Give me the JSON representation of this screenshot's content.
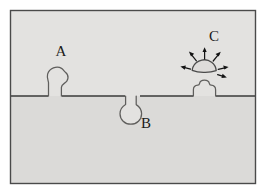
{
  "figure": {
    "frame": {
      "border_color": "#4a4a4a",
      "border_width": 1,
      "x": 10,
      "y": 10,
      "width": 246,
      "height": 174
    },
    "regions": [
      {
        "name": "upper-medium",
        "label": "",
        "fill": "#e3e2e0",
        "description": "region above the interface line"
      },
      {
        "name": "lower-substrate",
        "label": "",
        "fill": "#dbdad8",
        "description": "region below the interface line"
      }
    ],
    "interface": {
      "name": "surface-line",
      "y": 96,
      "stroke": "#3a3a3a",
      "stroke_width": 1.6
    },
    "features": [
      {
        "id": "A",
        "label": "A",
        "label_x": 61,
        "label_y": 56,
        "kind": "protruding-nucleus",
        "description": "irregular blob on a narrow neck rising above the surface",
        "outline_stroke": "#5a5a5a",
        "fill": "#e3e2e0"
      },
      {
        "id": "B",
        "label": "B",
        "label_x": 146,
        "label_y": 128,
        "kind": "subsurface-cavity",
        "description": "flask shaped cavity with narrow neck widening below the surface",
        "outline_stroke": "#5a5a5a",
        "fill": "#e3e2e0"
      },
      {
        "id": "C",
        "label": "C",
        "label_x": 214,
        "label_y": 41,
        "kind": "detaching-blob",
        "description": "detached cap shaped blob with radiating arrows above a residual surface bump",
        "outline_stroke": "#4a4a4a",
        "fill": "#dedcda",
        "arrow_color": "#141414",
        "arrow_count": 6
      }
    ]
  }
}
